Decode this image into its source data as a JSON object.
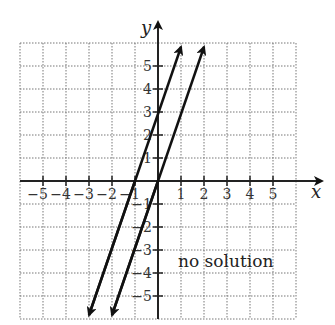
{
  "chart_data": {
    "type": "line",
    "title": "",
    "xlabel": "x",
    "ylabel": "y",
    "xlim": [
      -6,
      6
    ],
    "ylim": [
      -6,
      6
    ],
    "grid": true,
    "grid_style": "dotted",
    "x_ticks": [
      -5,
      -4,
      -3,
      -2,
      -1,
      1,
      2,
      3,
      4,
      5
    ],
    "y_ticks": [
      -5,
      -4,
      -3,
      -2,
      -1,
      1,
      2,
      3,
      4,
      5
    ],
    "x_tick_labels": [
      "−5",
      "−4",
      "−3",
      "−2",
      "−1",
      "1",
      "2",
      "3",
      "4",
      "5"
    ],
    "y_tick_labels": [
      "−5",
      "−4",
      "−3",
      "−2",
      "−1",
      "1",
      "2",
      "3",
      "4",
      "5"
    ],
    "series": [
      {
        "name": "line-1",
        "equation": "y = 3x + 3",
        "slope": 3,
        "intercept": 3,
        "x": [
          -3,
          1
        ],
        "y": [
          -6,
          6
        ],
        "arrows": "both"
      },
      {
        "name": "line-2",
        "equation": "y = 3x",
        "slope": 3,
        "intercept": 0,
        "x": [
          -2,
          2
        ],
        "y": [
          -6,
          6
        ],
        "arrows": "both"
      }
    ],
    "annotations": [
      {
        "text": "no solution",
        "x": 0.8,
        "y": -3.5
      }
    ],
    "legend": null
  },
  "labels": {
    "x_axis": "x",
    "y_axis": "y",
    "annotation": "no solution"
  }
}
